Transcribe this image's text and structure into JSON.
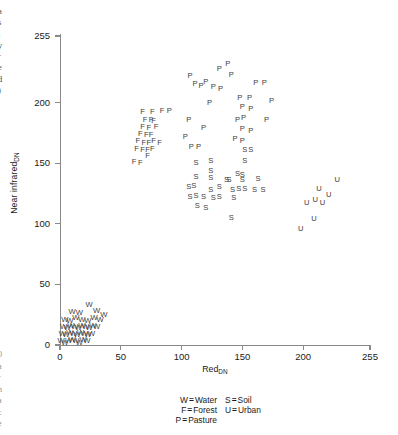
{
  "figure": {
    "margin_text_top": "a\ns\nl\ny\nr\ne\nd\n)",
    "margin_text_bottom": "0\na\nr\nn\na\nc\ne"
  },
  "axes": {
    "x": {
      "label": "Red",
      "label_subscript": "DN",
      "ticks": [
        0,
        50,
        100,
        150,
        200,
        255
      ],
      "min": 0,
      "max": 255
    },
    "y": {
      "label": "Near  infrared",
      "label_subscript": "DN",
      "ticks": [
        0,
        50,
        100,
        150,
        200,
        255
      ],
      "min": 0,
      "max": 255
    }
  },
  "legend": {
    "rows": [
      {
        "left": {
          "key": "W",
          "eq": "=",
          "name": "Water"
        },
        "right": {
          "key": "S",
          "eq": "=",
          "name": "Soil"
        }
      },
      {
        "left": {
          "key": "F",
          "eq": "=",
          "name": "Forest"
        },
        "right": {
          "key": "U",
          "eq": "=",
          "name": "Urban"
        }
      },
      {
        "left": {
          "key": "P",
          "eq": "=",
          "name": "Pasture"
        },
        "right": null
      }
    ]
  },
  "chart_data": {
    "type": "scatter",
    "title": "",
    "xlabel": "Red_DN",
    "ylabel": "Near infrared_DN",
    "xlim": [
      0,
      255
    ],
    "ylim": [
      0,
      255
    ],
    "grid": false,
    "legend_position": "below-axes",
    "point_marker": "class_letter",
    "series": [
      {
        "name": "Water",
        "marker": "W",
        "points": [
          [
            1,
            3
          ],
          [
            4,
            2
          ],
          [
            7,
            3
          ],
          [
            10,
            4
          ],
          [
            13,
            3
          ],
          [
            16,
            2
          ],
          [
            19,
            4
          ],
          [
            22,
            3
          ],
          [
            2,
            9
          ],
          [
            5,
            8
          ],
          [
            8,
            10
          ],
          [
            11,
            9
          ],
          [
            14,
            8
          ],
          [
            17,
            10
          ],
          [
            20,
            9
          ],
          [
            23,
            8
          ],
          [
            26,
            9
          ],
          [
            3,
            15
          ],
          [
            6,
            14
          ],
          [
            9,
            16
          ],
          [
            12,
            15
          ],
          [
            15,
            14
          ],
          [
            18,
            16
          ],
          [
            21,
            15
          ],
          [
            24,
            14
          ],
          [
            27,
            16
          ],
          [
            30,
            15
          ],
          [
            4,
            21
          ],
          [
            8,
            20
          ],
          [
            13,
            22
          ],
          [
            18,
            21
          ],
          [
            23,
            20
          ],
          [
            28,
            22
          ],
          [
            33,
            21
          ],
          [
            10,
            27
          ],
          [
            16,
            26
          ],
          [
            24,
            33
          ],
          [
            30,
            28
          ],
          [
            36,
            25
          ]
        ]
      },
      {
        "name": "Forest",
        "marker": "F",
        "points": [
          [
            61,
            151
          ],
          [
            66,
            150
          ],
          [
            72,
            156
          ],
          [
            63,
            162
          ],
          [
            68,
            161
          ],
          [
            72,
            161
          ],
          [
            76,
            162
          ],
          [
            64,
            168
          ],
          [
            69,
            167
          ],
          [
            73,
            167
          ],
          [
            77,
            168
          ],
          [
            82,
            167
          ],
          [
            66,
            174
          ],
          [
            71,
            173
          ],
          [
            75,
            173
          ],
          [
            79,
            180
          ],
          [
            68,
            180
          ],
          [
            73,
            179
          ],
          [
            77,
            185
          ],
          [
            70,
            186
          ],
          [
            75,
            186
          ],
          [
            68,
            192
          ],
          [
            76,
            192
          ],
          [
            84,
            193
          ]
        ]
      },
      {
        "name": "Pasture",
        "marker": "P",
        "points": [
          [
            90,
            193
          ],
          [
            106,
            186
          ],
          [
            103,
            172
          ],
          [
            108,
            163
          ],
          [
            114,
            163
          ],
          [
            118,
            179
          ],
          [
            123,
            200
          ],
          [
            126,
            213
          ],
          [
            120,
            217
          ],
          [
            116,
            214
          ],
          [
            111,
            215
          ],
          [
            107,
            222
          ],
          [
            132,
            211
          ],
          [
            131,
            228
          ],
          [
            138,
            232
          ],
          [
            141,
            223
          ],
          [
            146,
            186
          ],
          [
            151,
            187
          ],
          [
            150,
            196
          ],
          [
            157,
            195
          ],
          [
            148,
            204
          ],
          [
            156,
            204
          ],
          [
            150,
            178
          ],
          [
            157,
            177
          ],
          [
            150,
            168
          ],
          [
            161,
            216
          ],
          [
            168,
            216
          ],
          [
            170,
            186
          ],
          [
            174,
            201
          ],
          [
            144,
            170
          ]
        ]
      },
      {
        "name": "Soil",
        "marker": "S",
        "points": [
          [
            112,
            150
          ],
          [
            112,
            139
          ],
          [
            110,
            131
          ],
          [
            112,
            123
          ],
          [
            113,
            115
          ],
          [
            106,
            130
          ],
          [
            107,
            122
          ],
          [
            118,
            122
          ],
          [
            120,
            113
          ],
          [
            124,
            152
          ],
          [
            124,
            144
          ],
          [
            124,
            138
          ],
          [
            124,
            128
          ],
          [
            126,
            121
          ],
          [
            131,
            130
          ],
          [
            131,
            122
          ],
          [
            137,
            136
          ],
          [
            139,
            136
          ],
          [
            142,
            128
          ],
          [
            143,
            121
          ],
          [
            141,
            105
          ],
          [
            146,
            141
          ],
          [
            150,
            140
          ],
          [
            147,
            129
          ],
          [
            152,
            129
          ],
          [
            150,
            136
          ],
          [
            152,
            161
          ],
          [
            157,
            161
          ],
          [
            152,
            152
          ],
          [
            163,
            137
          ],
          [
            160,
            128
          ],
          [
            167,
            128
          ]
        ]
      },
      {
        "name": "Urban",
        "marker": "U",
        "points": [
          [
            198,
            96
          ],
          [
            203,
            117
          ],
          [
            209,
            104
          ],
          [
            210,
            120
          ],
          [
            213,
            129
          ],
          [
            216,
            117
          ],
          [
            221,
            124
          ],
          [
            228,
            136
          ]
        ]
      }
    ]
  }
}
